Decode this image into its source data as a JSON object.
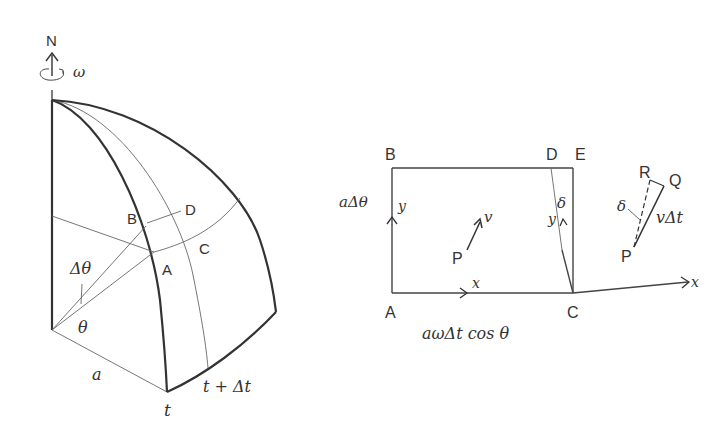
{
  "left_figure": {
    "axis_label": "N",
    "rotation_label": "ω",
    "points": {
      "A": "A",
      "B": "B",
      "C": "C",
      "D": "D"
    },
    "angle_delta_label": "Δθ",
    "angle_label": "θ",
    "radius_label": "a",
    "meridian_t_label": "t",
    "meridian_t_dt_label": "t + Δt"
  },
  "right_figure": {
    "corners": {
      "A": "A",
      "B": "B",
      "C": "C",
      "D": "D",
      "E": "E"
    },
    "side_label": "aΔθ",
    "bottom_label": "aωΔt cos θ",
    "x_label_a": "x",
    "y_label_a": "y",
    "x_label_c": "x",
    "y_label_c": "y",
    "delta_label": "δ",
    "particle_label": "P",
    "velocity_label": "v"
  },
  "vector_figure": {
    "P": "P",
    "Q": "Q",
    "R": "R",
    "delta_label": "δ",
    "displacement_label": "vΔt"
  }
}
